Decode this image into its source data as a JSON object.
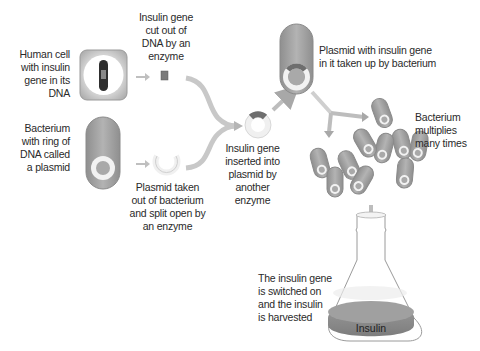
{
  "diagram": {
    "labels": {
      "human_cell": [
        "Human cell",
        "with insulin",
        "gene in its",
        "DNA"
      ],
      "gene_cut": [
        "Insulin gene",
        "cut out of",
        "DNA by an",
        "enzyme"
      ],
      "bacterium": [
        "Bacterium",
        "with ring of",
        "DNA called",
        "a plasmid"
      ],
      "plasmid_taken": [
        "Plasmid taken",
        "out of bacterium",
        "and split open by",
        "an enzyme"
      ],
      "gene_inserted": [
        "Insulin gene",
        "inserted into",
        "plasmid by",
        "another",
        "enzyme"
      ],
      "plasmid_taken_up": [
        "Plasmid with insulin gene",
        "in it taken up by bacterium"
      ],
      "multiplies": [
        "Bacterium",
        "multiplies",
        "many times"
      ],
      "switched_on": [
        "The insulin gene",
        "is switched on",
        "and the insulin",
        "is harvested"
      ],
      "flask_content": "Insulin"
    },
    "colors": {
      "cell_fill": "#a9a9a9",
      "cell_border": "#8a8a8a",
      "plasmid_ring": "#f2f2f2",
      "insulin_gene": "#6e6e6e",
      "arrow": "#bdbdbd",
      "flask_outline": "#9a9a9a",
      "flask_liquid": "#8c8c8c",
      "text": "#2a2a2a"
    }
  }
}
